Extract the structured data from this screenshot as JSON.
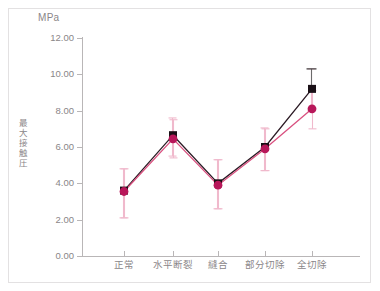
{
  "figure": {
    "unit_label": "MPa",
    "y_axis_title": "最大接触圧"
  },
  "chart_data": {
    "type": "line",
    "title": "",
    "xlabel": "",
    "ylabel": "最大接触圧",
    "unit": "MPa",
    "ylim": [
      0,
      12
    ],
    "ytick_labels": [
      "0.00",
      "2.00",
      "4.00",
      "6.00",
      "8.00",
      "10.00",
      "12.00"
    ],
    "ytick_values": [
      0,
      2,
      4,
      6,
      8,
      10,
      12
    ],
    "grid": false,
    "legend": "none",
    "categories": [
      "正常",
      "水平断裂",
      "縫合",
      "部分切除",
      "全切除"
    ],
    "series": [
      {
        "name": "series-black-square",
        "marker": "square",
        "color": "#1a1016",
        "line_color": "#2b1a24",
        "values": [
          3.6,
          6.65,
          4.0,
          6.0,
          9.2
        ],
        "err_low": [
          1.5,
          1.15,
          1.4,
          1.3,
          1.2
        ],
        "err_high": [
          1.2,
          0.95,
          1.3,
          1.05,
          1.1
        ]
      },
      {
        "name": "series-magenta-circle",
        "marker": "circle",
        "color": "#b8175a",
        "line_color": "#d9507f",
        "values": [
          3.55,
          6.45,
          3.9,
          5.9,
          8.1
        ],
        "err_low": [
          1.45,
          1.05,
          1.3,
          1.2,
          1.1
        ],
        "err_high": [
          1.25,
          1.05,
          1.4,
          1.1,
          1.0
        ]
      }
    ],
    "errorbar_color": "#f0b9cc"
  }
}
